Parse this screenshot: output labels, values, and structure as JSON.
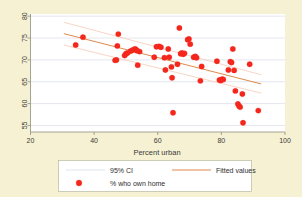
{
  "chart_data": {
    "type": "scatter",
    "title": "",
    "xlabel": "Percent urban",
    "ylabel": "",
    "xlim": [
      20,
      100
    ],
    "ylim": [
      53.5,
      80.5
    ],
    "xticks": [
      20,
      40,
      60,
      80,
      100
    ],
    "yticks": [
      55,
      60,
      65,
      70,
      75,
      80
    ],
    "grid": "horizontal",
    "legend_position": "below-plot",
    "series": [
      {
        "name": "% who own home",
        "type": "scatter",
        "marker": "filled-circle",
        "color": "#f4271c",
        "points": [
          [
            34.2,
            73.4
          ],
          [
            36.5,
            75.2
          ],
          [
            46.6,
            69.9
          ],
          [
            47.0,
            70.0
          ],
          [
            47.3,
            73.2
          ],
          [
            47.6,
            75.9
          ],
          [
            49.6,
            71.0
          ],
          [
            50.0,
            71.4
          ],
          [
            50.5,
            71.6
          ],
          [
            51.4,
            72.0
          ],
          [
            52.0,
            72.2
          ],
          [
            52.6,
            72.4
          ],
          [
            52.9,
            72.5
          ],
          [
            53.2,
            72.3
          ],
          [
            53.5,
            72.1
          ],
          [
            53.7,
            68.8
          ],
          [
            54.3,
            71.9
          ],
          [
            58.9,
            70.6
          ],
          [
            59.6,
            73.0
          ],
          [
            60.4,
            73.1
          ],
          [
            61.0,
            72.9
          ],
          [
            62.1,
            70.5
          ],
          [
            62.4,
            67.7
          ],
          [
            63.3,
            72.5
          ],
          [
            63.6,
            70.6
          ],
          [
            64.3,
            68.4
          ],
          [
            64.5,
            65.9
          ],
          [
            64.8,
            57.9
          ],
          [
            66.2,
            69.0
          ],
          [
            66.8,
            77.3
          ],
          [
            67.2,
            71.4
          ],
          [
            67.6,
            71.6
          ],
          [
            68.0,
            71.3
          ],
          [
            68.4,
            71.5
          ],
          [
            69.4,
            74.6
          ],
          [
            69.8,
            74.8
          ],
          [
            70.2,
            73.6
          ],
          [
            71.3,
            70.6
          ],
          [
            71.8,
            70.8
          ],
          [
            72.2,
            70.5
          ],
          [
            73.4,
            65.2
          ],
          [
            73.8,
            68.5
          ],
          [
            78.6,
            69.7
          ],
          [
            79.4,
            65.4
          ],
          [
            79.8,
            65.3
          ],
          [
            80.2,
            65.6
          ],
          [
            80.6,
            65.5
          ],
          [
            82.2,
            67.7
          ],
          [
            82.8,
            69.6
          ],
          [
            83.2,
            69.4
          ],
          [
            83.6,
            72.5
          ],
          [
            84.0,
            67.6
          ],
          [
            84.4,
            62.9
          ],
          [
            85.2,
            59.9
          ],
          [
            85.6,
            59.4
          ],
          [
            85.9,
            59.2
          ],
          [
            86.6,
            62.2
          ],
          [
            86.8,
            55.6
          ],
          [
            88.9,
            69.0
          ],
          [
            91.6,
            58.4
          ]
        ]
      },
      {
        "name": "Fitted values",
        "type": "line",
        "color": "#e08a4a",
        "points": [
          [
            30.5,
            76.0
          ],
          [
            92.5,
            64.5
          ]
        ]
      },
      {
        "name": "95% CI",
        "type": "band",
        "color": "#f3c3ac",
        "upper": [
          [
            30.5,
            78.6
          ],
          [
            92.5,
            66.6
          ]
        ],
        "lower": [
          [
            30.5,
            73.4
          ],
          [
            92.5,
            62.4
          ]
        ]
      }
    ]
  },
  "axes": {
    "x": {
      "label": "Percent urban",
      "tick_labels": [
        "20",
        "40",
        "60",
        "80",
        "100"
      ]
    },
    "y": {
      "label": "",
      "tick_labels": [
        "55",
        "60",
        "65",
        "70",
        "75",
        "80"
      ]
    }
  },
  "legend": {
    "entries": [
      {
        "label": "95% CI",
        "marker": "line",
        "color": "#dfe4ee"
      },
      {
        "label": "Fitted values",
        "marker": "line",
        "color": "#e08a4a"
      },
      {
        "label": "% who own home",
        "marker": "circle",
        "color": "#f4271c"
      }
    ]
  },
  "colors": {
    "background": "#f6f1d2",
    "panel": "#ffffff",
    "marker": "#f4271c",
    "fit_line": "#e08a4a",
    "ci_line": "#f3c3ac",
    "grid": "#c9cfe0",
    "axis": "#8f8f7a"
  }
}
